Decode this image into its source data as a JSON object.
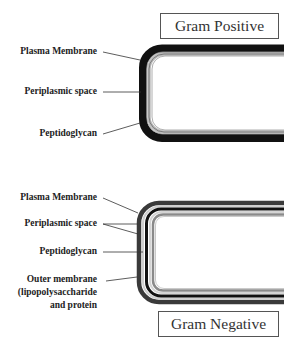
{
  "gram_positive": {
    "title": "Gram Positive",
    "labels": {
      "plasma_membrane": "Plasma Membrane",
      "periplasmic_space": "Periplasmic space",
      "peptidoglycan": "Peptidoglycan"
    }
  },
  "gram_negative": {
    "title": "Gram Negative",
    "labels": {
      "plasma_membrane": "Plasma Membrane",
      "periplasmic_space": "Periplasmic space",
      "peptidoglycan": "Peptidoglycan",
      "outer_membrane_line1": "Outer membrane",
      "outer_membrane_line2": "(lipopolysaccharide",
      "outer_membrane_line3": "and protein"
    }
  },
  "colors": {
    "background": "#ffffff",
    "peptidoglycan": "#111111",
    "membrane": "#888888",
    "outer_membrane": "#333333",
    "leader_line": "#333333"
  }
}
